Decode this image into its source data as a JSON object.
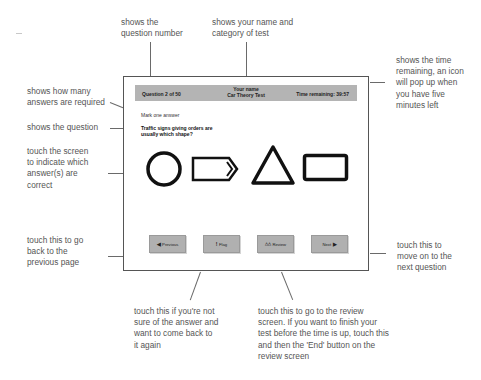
{
  "annotations": {
    "question_number": "shows the question number",
    "name_category": "shows your name and category of test",
    "time_remaining": "shows the time remaining, an icon will pop up when you have five minutes left",
    "answers_required": "shows how many answers are required",
    "question": "shows the question",
    "touch_screen": "touch the screen to indicate which answer(s) are correct",
    "previous": "touch this to go back to the previous page",
    "next": "touch this to move on to the next question",
    "flag": "touch this if you're not sure of the answer and want to come back to it again",
    "review": "touch this to go to the review screen. If you want to finish your test before the time is up, touch this and then the 'End' button on the review screen"
  },
  "annotation_lines": {
    "question_number": [
      "shows the",
      "question number"
    ],
    "name_category": [
      "shows your name and",
      "category of test"
    ],
    "time_remaining": [
      "shows the time",
      "remaining, an icon",
      "will pop up when",
      "you have five",
      "minutes left"
    ],
    "answers_required": [
      "shows how many",
      "answers are required"
    ],
    "question": [
      "shows the question"
    ],
    "touch_screen": [
      "touch the screen",
      "to indicate which",
      "answer(s) are",
      "correct"
    ],
    "previous": [
      "touch this to go",
      "back to the",
      "previous page"
    ],
    "next": [
      "touch this to",
      "move on to the",
      "next question"
    ],
    "flag": [
      "touch this if you're not",
      "sure of the answer and",
      "want to come back to",
      "it again"
    ],
    "review": [
      "touch this to go to the review",
      "screen. If you want to finish your",
      "test before the time is up, touch this",
      "and then the 'End' button on the",
      "review screen"
    ]
  },
  "screen": {
    "header": {
      "question_counter": "Question 2 of 50",
      "candidate_name": "Your name",
      "test_category": "Car Theory Test",
      "time_remaining": "Time remaining: 39:57"
    },
    "instruction": "Mark one answer",
    "question_text": "Traffic signs giving orders are usually which shape?",
    "answers": [
      {
        "id": "circle",
        "icon": "circle-shape"
      },
      {
        "id": "arrow-rectangle",
        "icon": "arrow-rectangle-shape"
      },
      {
        "id": "triangle",
        "icon": "triangle-shape"
      },
      {
        "id": "rectangle",
        "icon": "rectangle-shape"
      }
    ],
    "buttons": {
      "previous": {
        "label": "Previous",
        "icon": "left-arrow-icon",
        "glyph": "◀"
      },
      "flag": {
        "label": "Flag",
        "icon": "exclamation-icon",
        "glyph": "!"
      },
      "review": {
        "label": "Review",
        "icon": "review-icon",
        "glyph": "△△"
      },
      "next": {
        "label": "Next",
        "icon": "right-arrow-icon",
        "glyph": "▶"
      }
    },
    "colors": {
      "header_bg": "#b4b4b4",
      "button_bg": "#b0b0b0",
      "shape_stroke": "#111111"
    }
  }
}
